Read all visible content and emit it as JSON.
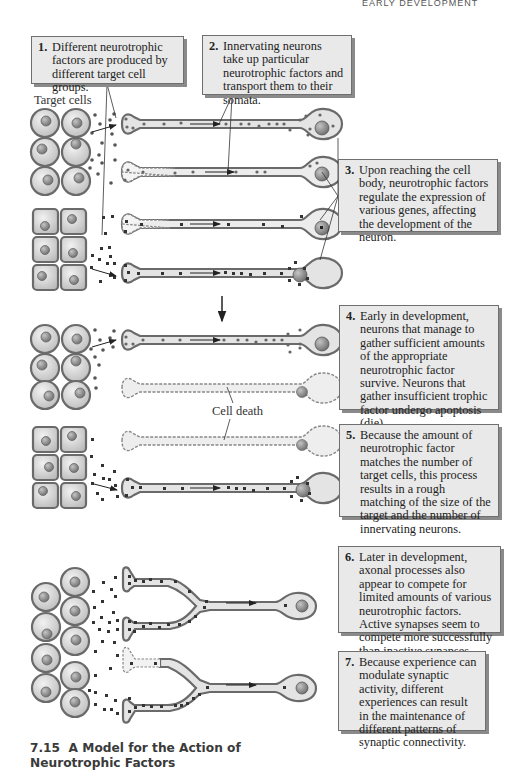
{
  "header": {
    "running_head": "EARLY DEVELOPMENT"
  },
  "labels": {
    "target_cells": "Target cells",
    "cell_death": "Cell death"
  },
  "callouts": [
    {
      "number": "1.",
      "text": "Different neurotrophic factors are produced by different target cell groups."
    },
    {
      "number": "2.",
      "text": "Innervating neurons take up particular neurotrophic factors and transport them to their somata."
    },
    {
      "number": "3.",
      "text": "Upon reaching the cell body, neurotrophic factors regulate the expression of various genes, affecting the development of the neuron."
    },
    {
      "number": "4.",
      "text": "Early in development, neurons that manage to gather sufficient amounts of the appropriate neurotrophic factor survive. Neurons that gather insufficient trophic factor undergo apoptosis (die)."
    },
    {
      "number": "5.",
      "text": "Because the amount of neurotrophic factor matches the number of target cells, this process results in a rough matching of the size of the target and the number of innervating neurons."
    },
    {
      "number": "6.",
      "text": "Later in development, axonal processes also appear to compete for limited amounts of various neurotrophic factors. Active synapses seem to compete more successfully than inactive synapses."
    },
    {
      "number": "7.",
      "text": "Because experience can modulate synaptic activity, different experiences can result in the maintenance of different patterns of synaptic connectivity."
    }
  ],
  "caption": {
    "figure_number": "7.15",
    "title": "A Model for the Action of Neurotrophic Factors"
  },
  "colors": {
    "callout_fill": "#e9e9e9",
    "cell_fill": "#d6d6d6",
    "cell_outline": "#6a6a6a",
    "nucleus": "#8c8c8c",
    "neuron_fill": "#e4e4e4",
    "factor_dot": "#4a4a4a"
  }
}
